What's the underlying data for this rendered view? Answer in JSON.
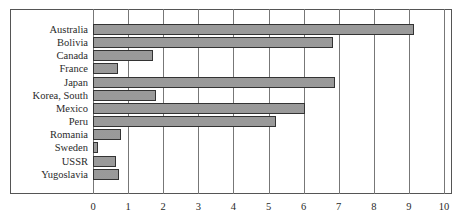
{
  "chart_data": {
    "type": "bar",
    "orientation": "horizontal",
    "title": "",
    "xlabel": "",
    "ylabel": "",
    "categories": [
      "Australia",
      "Bolivia",
      "Canada",
      "France",
      "Japan",
      "Korea, South",
      "Mexico",
      "Peru",
      "Romania",
      "Sweden",
      "USSR",
      "Yugoslavia"
    ],
    "values": [
      9.15,
      6.85,
      1.7,
      0.7,
      6.9,
      1.8,
      6.05,
      5.2,
      0.8,
      0.15,
      0.65,
      0.75
    ],
    "xlim": [
      0,
      10
    ],
    "xticks": [
      "0",
      "1",
      "2",
      "3",
      "4",
      "5",
      "6",
      "7",
      "8",
      "9",
      "10"
    ],
    "grid": "vertical",
    "legend": null,
    "bar_fill": "dotted gray pattern"
  },
  "colors": {
    "bar_fill": "#d8d8d8",
    "bar_border": "#333333",
    "grid": "#777777",
    "text": "#2a2a2a"
  }
}
